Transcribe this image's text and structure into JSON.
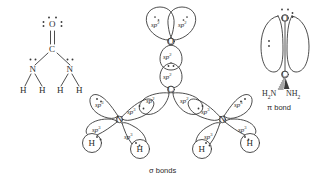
{
  "figure": {
    "background_color": "#ffffff",
    "stroke_color": "#3a3a3a",
    "text_color": "#2b2b2b"
  },
  "panels": {
    "lewis": {
      "name": "lewis-structure",
      "atoms": {
        "oxygen": "O",
        "carbon": "C",
        "nitrogen_left": "N",
        "nitrogen_right": "N",
        "hydrogen_1": "H",
        "hydrogen_2": "H",
        "hydrogen_3": "H",
        "hydrogen_4": "H"
      },
      "bonds": {
        "co": "double",
        "cn_left": "single",
        "cn_right": "single",
        "nh": "single"
      },
      "lone_pairs": {
        "oxygen": 2,
        "nitrogen_left": 1,
        "nitrogen_right": 1
      }
    },
    "sigma": {
      "name": "sigma-bond-framework",
      "caption": "σ bonds",
      "atoms": {
        "oxygen": "O",
        "carbon": "C",
        "nitrogen_left": "N",
        "nitrogen_right": "N",
        "hydrogen_1": "H",
        "hydrogen_2": "H",
        "hydrogen_3": "H",
        "hydrogen_4": "H"
      },
      "orbitals": {
        "o_lobe_left": "sp",
        "o_lobe_right": "sp",
        "o_lobe_down": "sp",
        "c_lobe_up": "sp",
        "c_lobe_left": "sp",
        "c_lobe_right": "sp",
        "nl_lonepair": "sp",
        "nl_to_c": "sp",
        "nl_to_h1": "sp",
        "nl_to_h2": "sp",
        "nr_lonepair": "sp",
        "nr_to_c": "sp",
        "nr_to_h3": "sp",
        "nr_to_h4": "sp",
        "sp2_exp": "2",
        "sp3_exp": "3"
      }
    },
    "pi": {
      "name": "pi-bond-overlap",
      "caption": "π bond",
      "atoms": {
        "oxygen": "O",
        "carbon": "C",
        "amine_left": "H",
        "amine_left_sub": "2",
        "amine_left_n": "N",
        "amine_right_n": "NH",
        "amine_right_sub": "2"
      },
      "lone_pairs": {
        "oxygen_top": 2,
        "oxygen_right": 2,
        "p_lobe_left": 2
      }
    }
  }
}
